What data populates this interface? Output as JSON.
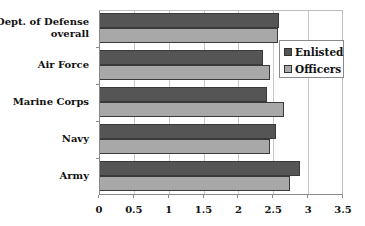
{
  "chart_data": {
    "type": "bar",
    "orientation": "horizontal",
    "title": "",
    "xlabel": "",
    "ylabel": "",
    "categories": [
      "Dept. of Defense overall",
      "Air Force",
      "Marine Corps",
      "Navy",
      "Army"
    ],
    "category_labels_lines": [
      [
        "Dept. of Defense",
        "overall"
      ],
      [
        "Air Force"
      ],
      [
        "Marine Corps"
      ],
      [
        "Navy"
      ],
      [
        "Army"
      ]
    ],
    "series": [
      {
        "name": "Enlisted",
        "color": "#555555",
        "values": [
          2.57,
          2.34,
          2.39,
          2.53,
          2.87
        ]
      },
      {
        "name": "Officers",
        "color": "#a8a8a8",
        "values": [
          2.56,
          2.44,
          2.64,
          2.44,
          2.73
        ]
      }
    ],
    "xlim": [
      0,
      3.5
    ],
    "xticks": [
      0,
      0.5,
      1,
      1.5,
      2,
      2.5,
      3,
      3.5
    ],
    "xtick_labels": [
      "0",
      "0.5",
      "1",
      "1.5",
      "2",
      "2.5",
      "3",
      "3.5"
    ],
    "grid": "vertical",
    "legend": {
      "position": "right-inside",
      "entries": [
        "Enlisted",
        "Officers"
      ]
    }
  }
}
